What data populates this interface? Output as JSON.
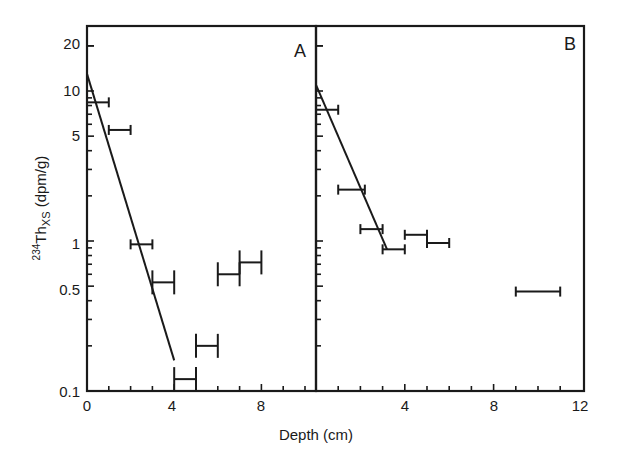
{
  "chart_data": [
    {
      "panel": "A",
      "type": "scatter",
      "title": "",
      "xlabel": "Depth (cm)",
      "ylabel": "234Th_xs (dpm/g)",
      "yscale": "log",
      "xlim": [
        0,
        10.5
      ],
      "ylim": [
        0.1,
        25
      ],
      "x_ticks": [
        0,
        4,
        8
      ],
      "y_ticks": [
        0.1,
        0.5,
        1,
        5,
        10,
        20
      ],
      "grid": false,
      "points": [
        {
          "x_from": 0,
          "x_to": 1,
          "y": 8.4
        },
        {
          "x_from": 1,
          "x_to": 2,
          "y": 5.5
        },
        {
          "x_from": 2,
          "x_to": 3,
          "y": 0.95
        },
        {
          "x_from": 3,
          "x_to": 4,
          "y": 0.53
        },
        {
          "x_from": 4,
          "x_to": 5,
          "y": 0.12
        },
        {
          "x_from": 5,
          "x_to": 6,
          "y": 0.2
        },
        {
          "x_from": 6,
          "x_to": 7,
          "y": 0.6
        },
        {
          "x_from": 7,
          "x_to": 8,
          "y": 0.72
        }
      ],
      "fit_line": {
        "x": [
          0,
          4
        ],
        "y": [
          13,
          0.16
        ]
      }
    },
    {
      "panel": "B",
      "type": "scatter",
      "title": "",
      "xlabel": "Depth (cm)",
      "ylabel": "234Th_xs (dpm/g)",
      "yscale": "log",
      "xlim": [
        0,
        12.5
      ],
      "ylim": [
        0.1,
        25
      ],
      "x_ticks": [
        4,
        8,
        12
      ],
      "y_ticks": [
        0.1,
        0.5,
        1,
        5,
        10,
        20
      ],
      "grid": false,
      "points": [
        {
          "x_from": 0,
          "x_to": 1,
          "y": 7.5
        },
        {
          "x_from": 1,
          "x_to": 2.2,
          "y": 2.2
        },
        {
          "x_from": 2,
          "x_to": 3,
          "y": 1.2
        },
        {
          "x_from": 3,
          "x_to": 4,
          "y": 0.88
        },
        {
          "x_from": 4,
          "x_to": 5,
          "y": 1.1
        },
        {
          "x_from": 5,
          "x_to": 6,
          "y": 0.97
        },
        {
          "x_from": 9,
          "x_to": 11,
          "y": 0.46
        }
      ],
      "fit_line": {
        "x": [
          0,
          3.2
        ],
        "y": [
          11,
          0.88
        ]
      }
    }
  ],
  "labels": {
    "panel_a": "A",
    "panel_b": "B",
    "y_axis_prefix": "234",
    "y_axis_main": "Th",
    "y_axis_sub": "XS",
    "y_axis_unit": " (dpm/g)",
    "x_axis": "Depth (cm)",
    "y_tick_labels": [
      "20",
      "10",
      "5",
      "1",
      "0.5",
      "0.1"
    ],
    "x_tick_labels_a": [
      "0",
      "4",
      "8"
    ],
    "x_tick_labels_b": [
      "4",
      "8",
      "12"
    ]
  }
}
